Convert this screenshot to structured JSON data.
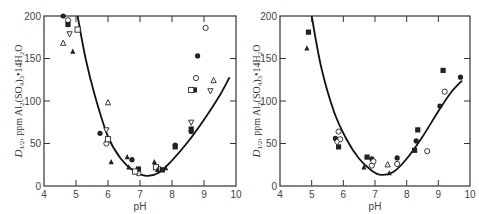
{
  "chart_data": [
    {
      "type": "scatter",
      "panel": "left",
      "title": "",
      "xlabel": "pH",
      "ylabel": "D1/2, ppm Al2(SO4)3·14H2O",
      "xlim": [
        4,
        10
      ],
      "ylim": [
        0,
        200
      ],
      "xticks": [
        4,
        5,
        6,
        7,
        8,
        9,
        10
      ],
      "yticks": [
        0,
        50,
        100,
        150,
        200
      ],
      "grid": false,
      "legend": null,
      "curve": {
        "description": "fitted U-shaped curve",
        "points": [
          [
            5.05,
            200
          ],
          [
            5.3,
            150
          ],
          [
            5.6,
            105
          ],
          [
            6.0,
            58
          ],
          [
            6.4,
            32
          ],
          [
            6.8,
            18
          ],
          [
            7.2,
            12
          ],
          [
            7.6,
            16
          ],
          [
            8.0,
            30
          ],
          [
            8.5,
            52
          ],
          [
            9.0,
            78
          ],
          [
            9.5,
            107
          ],
          [
            9.8,
            128
          ]
        ]
      },
      "series": [
        {
          "name": "filled-circle",
          "marker": "●",
          "points": [
            [
              4.6,
              200
            ],
            [
              5.75,
              62
            ],
            [
              6.75,
              31
            ],
            [
              8.1,
              48
            ],
            [
              8.6,
              64
            ],
            [
              8.8,
              153
            ]
          ]
        },
        {
          "name": "open-circle",
          "marker": "○",
          "points": [
            [
              4.75,
              195
            ],
            [
              5.95,
              50
            ],
            [
              6.95,
              15
            ],
            [
              7.6,
              20
            ],
            [
              8.75,
              127
            ],
            [
              9.05,
              186
            ]
          ]
        },
        {
          "name": "filled-square",
          "marker": "■",
          "points": [
            [
              4.75,
              190
            ],
            [
              6.95,
              20
            ],
            [
              7.7,
              19
            ],
            [
              8.1,
              46
            ],
            [
              8.7,
              113
            ],
            [
              8.6,
              67
            ]
          ]
        },
        {
          "name": "open-square",
          "marker": "□",
          "points": [
            [
              5.05,
              184
            ],
            [
              6.0,
              55
            ],
            [
              6.85,
              17
            ],
            [
              7.5,
              22
            ],
            [
              8.6,
              113
            ]
          ]
        },
        {
          "name": "filled-triangle",
          "marker": "▲",
          "points": [
            [
              4.9,
              158
            ],
            [
              6.1,
              28
            ],
            [
              6.6,
              34
            ],
            [
              6.65,
              22
            ],
            [
              7.45,
              28
            ],
            [
              7.55,
              19
            ],
            [
              7.8,
              21
            ]
          ]
        },
        {
          "name": "open-triangle",
          "marker": "△",
          "points": [
            [
              4.6,
              168
            ],
            [
              6.0,
              98
            ],
            [
              9.3,
              124
            ]
          ]
        },
        {
          "name": "open-inverted-triangle",
          "marker": "▽",
          "points": [
            [
              4.8,
              179
            ],
            [
              5.95,
              66
            ],
            [
              8.6,
              75
            ],
            [
              9.2,
              112
            ]
          ]
        }
      ]
    },
    {
      "type": "scatter",
      "panel": "right",
      "title": "",
      "xlabel": "pH",
      "ylabel": "D1/2, ppm Al2(SO4)3·14H2O",
      "xlim": [
        4,
        10
      ],
      "ylim": [
        0,
        200
      ],
      "xticks": [
        4,
        5,
        6,
        7,
        8,
        9,
        10
      ],
      "yticks": [
        0,
        50,
        100,
        150,
        200
      ],
      "grid": false,
      "legend": null,
      "curve": {
        "description": "fitted U-shaped curve",
        "points": [
          [
            5.0,
            200
          ],
          [
            5.3,
            140
          ],
          [
            5.7,
            88
          ],
          [
            6.1,
            55
          ],
          [
            6.5,
            32
          ],
          [
            6.9,
            18
          ],
          [
            7.2,
            13
          ],
          [
            7.6,
            17
          ],
          [
            8.0,
            32
          ],
          [
            8.5,
            58
          ],
          [
            9.0,
            88
          ],
          [
            9.4,
            110
          ],
          [
            9.75,
            124
          ]
        ]
      },
      "series": [
        {
          "name": "filled-square",
          "marker": "■",
          "points": [
            [
              4.9,
              181
            ],
            [
              5.85,
              46
            ],
            [
              6.75,
              34
            ],
            [
              8.25,
              42
            ],
            [
              8.35,
              66
            ],
            [
              9.15,
              136
            ]
          ]
        },
        {
          "name": "filled-circle",
          "marker": "●",
          "points": [
            [
              5.75,
              56
            ],
            [
              6.9,
              32
            ],
            [
              7.7,
              33
            ],
            [
              8.3,
              53
            ],
            [
              9.05,
              94
            ],
            [
              9.7,
              128
            ]
          ]
        },
        {
          "name": "filled-triangle",
          "marker": "▲",
          "points": [
            [
              4.85,
              162
            ],
            [
              6.65,
              22
            ],
            [
              7.45,
              15
            ]
          ]
        },
        {
          "name": "open-circle",
          "marker": "○",
          "points": [
            [
              5.85,
              64
            ],
            [
              5.9,
              55
            ],
            [
              6.9,
              24
            ],
            [
              6.95,
              29
            ],
            [
              7.7,
              26
            ],
            [
              8.65,
              41
            ],
            [
              9.2,
              111
            ]
          ]
        },
        {
          "name": "open-triangle",
          "marker": "△",
          "points": [
            [
              7.4,
              25
            ]
          ]
        },
        {
          "name": "open-diamond",
          "marker": "◇",
          "points": [
            [
              5.8,
              52
            ]
          ]
        }
      ]
    }
  ],
  "labels": {
    "left": {
      "xlabel": "pH",
      "ylabel_main": "D",
      "ylabel_sub": "1/2",
      "ylabel_rest": ", ppm Al",
      "ylabel_tail": "(SO",
      "ylabel_tail2": ")",
      "ylabel_end": "•14H",
      "ylabel_o": "O"
    },
    "right": {
      "xlabel": "pH",
      "ylabel_main": "D",
      "ylabel_sub": "1/2",
      "ylabel_rest": ", ppm Al",
      "ylabel_tail": "(SO",
      "ylabel_tail2": ")",
      "ylabel_end": "•14H",
      "ylabel_o": "O"
    },
    "xticks": [
      "4",
      "5",
      "6",
      "7",
      "8",
      "9",
      "10"
    ],
    "yticks": [
      "0",
      "50",
      "100",
      "150",
      "200"
    ]
  }
}
